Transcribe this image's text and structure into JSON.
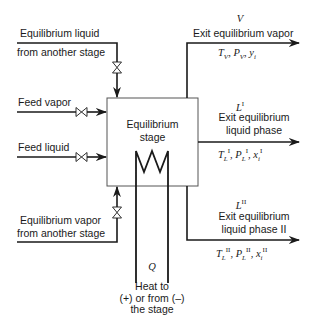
{
  "diagram": {
    "stage": {
      "label_line1": "Equilibrium",
      "label_line2": "stage"
    },
    "inputs": {
      "liquid_from_stage": {
        "line1": "Equilibrium liquid",
        "line2": "from another stage"
      },
      "feed_vapor": {
        "label": "Feed vapor"
      },
      "feed_liquid": {
        "label": "Feed liquid"
      },
      "vapor_from_stage": {
        "line1": "Equilibrium vapor",
        "line2": "from another stage"
      }
    },
    "outputs": {
      "vapor": {
        "symbol": "V",
        "label": "Exit equilibrium vapor",
        "props": {
          "T": "T",
          "T_sub": "V",
          "P": "P",
          "P_sub": "V",
          "y": "y",
          "y_sub": "i"
        }
      },
      "liquid_1": {
        "symbol": "L",
        "symbol_sup": "I",
        "line1": "Exit equilibrium",
        "line2": "liquid phase",
        "props": {
          "T": "T",
          "T_sub": "L",
          "T_sup": "I",
          "P": "P",
          "P_sub": "L",
          "P_sup": "I",
          "x": "x",
          "x_sub": "i",
          "x_sup": "I"
        }
      },
      "liquid_2": {
        "symbol": "L",
        "symbol_sup": "II",
        "line1": "Exit equilibrium",
        "line2": "liquid phase II",
        "props": {
          "T": "T",
          "T_sub": "L",
          "T_sup": "II",
          "P": "P",
          "P_sub": "L",
          "P_sup": "II",
          "x": "x",
          "x_sub": "i",
          "x_sup": "II"
        }
      }
    },
    "heat": {
      "symbol": "Q",
      "line1": "Heat to",
      "line2": "(+) or from (–)",
      "line3": "the stage"
    },
    "icons": [
      "valve-icon",
      "arrow-icon",
      "heat-exchanger-coil-icon"
    ],
    "colors": {
      "line": "#1a1a1a",
      "box_border": "#555555",
      "background": "#ffffff"
    }
  }
}
